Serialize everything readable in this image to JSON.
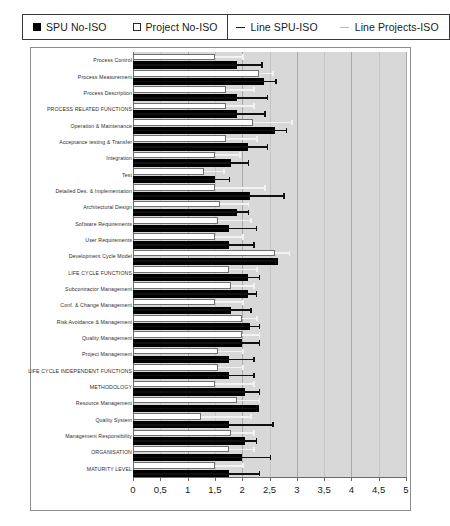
{
  "legend": {
    "entries": [
      {
        "label": "SPU No-ISO",
        "marker": "filled-square"
      },
      {
        "label": "Project No-ISO",
        "marker": "hollow-square"
      },
      {
        "label": "Line SPU-ISO",
        "marker": "dark-line"
      },
      {
        "label": "Line Projects-ISO",
        "marker": "light-line"
      }
    ]
  },
  "chart_data": {
    "type": "bar",
    "orientation": "horizontal",
    "title": "",
    "xlabel": "",
    "ylabel": "",
    "xlim": [
      0,
      5
    ],
    "grid": true,
    "legend_position": "top",
    "xticks": [
      "0",
      "0,5",
      "1",
      "1,5",
      "2",
      "2,5",
      "3",
      "3,5",
      "4",
      "4,5",
      "5"
    ],
    "xtick_values": [
      0,
      0.5,
      1,
      1.5,
      2,
      2.5,
      3,
      3.5,
      4,
      4.5,
      5
    ],
    "categories": [
      "Process Control",
      "Process Measurement",
      "Process Description",
      "PROCESS RELATED FUNCTIONS",
      "Operation & Maintenance",
      "Acceptance testing & Transfer",
      "Integration",
      "Test",
      "Detailed Des. & Implementation",
      "Architectural Design",
      "Software Requirements",
      "User Requirements",
      "Development Cycle Model",
      "LIFE CYCLE FUNCTIONS",
      "Subcontractor Management",
      "Conf. & Change Management",
      "Risk Avoidance & Management",
      "Quality Management",
      "Project Management",
      "LIFE CYCLE INDEPENDENT FUNCTIONS",
      "METHODOLOGY",
      "Resource Management",
      "Quality System",
      "Management Responsibility",
      "ORGANISATION",
      "MATURITY LEVEL"
    ],
    "series": [
      {
        "name": "Project No-ISO",
        "marker": "hollow-square",
        "values": [
          1.5,
          2.3,
          1.7,
          1.7,
          2.2,
          1.7,
          1.5,
          1.3,
          1.5,
          1.6,
          1.55,
          1.5,
          2.6,
          1.75,
          1.8,
          1.5,
          2.0,
          2.0,
          1.55,
          1.55,
          1.5,
          1.9,
          1.25,
          1.8,
          1.75,
          1.5
        ]
      },
      {
        "name": "SPU No-ISO",
        "marker": "filled-square",
        "values": [
          1.9,
          2.4,
          1.9,
          1.9,
          2.6,
          2.1,
          1.8,
          1.5,
          2.15,
          1.9,
          1.75,
          1.75,
          2.65,
          2.1,
          2.1,
          1.8,
          2.15,
          2.0,
          1.75,
          1.75,
          2.05,
          2.3,
          1.75,
          2.05,
          2.0,
          1.75
        ]
      },
      {
        "name": "Line Projects-ISO",
        "marker": "light-line",
        "values": [
          2.0,
          2.55,
          2.2,
          2.2,
          2.9,
          2.25,
          1.95,
          1.65,
          2.4,
          2.1,
          2.15,
          2.0,
          2.85,
          2.25,
          2.2,
          2.0,
          2.25,
          2.3,
          2.0,
          2.0,
          2.2,
          2.3,
          2.15,
          2.2,
          2.2,
          2.0
        ]
      },
      {
        "name": "Line SPU-ISO",
        "marker": "dark-line",
        "values": [
          2.35,
          2.6,
          2.45,
          2.4,
          2.8,
          2.45,
          2.1,
          1.75,
          2.75,
          2.1,
          2.25,
          2.2,
          2.6,
          2.3,
          2.25,
          2.15,
          2.3,
          2.3,
          2.2,
          2.2,
          2.3,
          2.25,
          2.55,
          2.25,
          2.5,
          2.3
        ]
      }
    ]
  }
}
